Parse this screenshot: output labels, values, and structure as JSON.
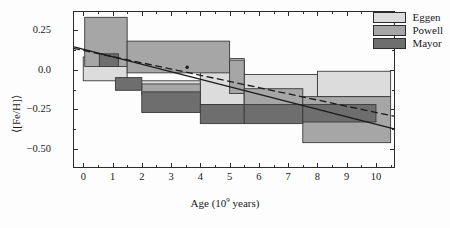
{
  "chart_data": {
    "type": "bar",
    "title": "",
    "xlabel": "Age (10⁹ years)",
    "ylabel": "⟨[Fe/H]⟩",
    "xlabel_base": "Age (10",
    "xlabel_exp": "9",
    "xlabel_tail": " years)",
    "xlim": [
      -0.35,
      10.65
    ],
    "ylim": [
      -0.62,
      0.37
    ],
    "grid": false,
    "legend_position": "top-right",
    "xticks": [
      0,
      1,
      2,
      3,
      4,
      5,
      6,
      7,
      8,
      9,
      10
    ],
    "xticklabels": [
      "0",
      "1",
      "2",
      "3",
      "4",
      "5",
      "6",
      "7",
      "8",
      "9",
      "10"
    ],
    "xminorticks": [
      0.5,
      1.5,
      2.5,
      3.5,
      4.5,
      5.5,
      6.5,
      7.5,
      8.5,
      9.5,
      10.5
    ],
    "yticks": [
      0.25,
      0.0,
      -0.25,
      -0.5
    ],
    "yticklabels": [
      "0.25",
      "0.0",
      "−0.25",
      "−0.50"
    ],
    "yminorticks": [
      0.375,
      0.125,
      -0.125,
      -0.375,
      -0.625
    ],
    "colors": {
      "eggen": "#dcdcdc",
      "powell": "#a6a6a6",
      "mayor": "#6e6e6e",
      "edge": "#3a3a3a",
      "axis": "#2b2b2b",
      "text": "#1a1a1a"
    },
    "series": [
      {
        "name": "Eggen",
        "color": "#dcdcdc",
        "boxes": [
          {
            "x0": 0.0,
            "x1": 1.5,
            "y0": -0.07,
            "y1": 0.08
          },
          {
            "x0": 1.5,
            "x1": 4.0,
            "y0": -0.12,
            "y1": -0.07
          },
          {
            "x0": 4.0,
            "x1": 5.5,
            "y0": -0.22,
            "y1": 0.07
          },
          {
            "x0": 5.5,
            "x1": 8.0,
            "y0": -0.22,
            "y1": -0.03
          },
          {
            "x0": 8.0,
            "x1": 10.5,
            "y0": -0.17,
            "y1": -0.01
          }
        ]
      },
      {
        "name": "Powell",
        "color": "#a6a6a6",
        "boxes": [
          {
            "x0": 0.05,
            "x1": 1.5,
            "y0": 0.02,
            "y1": 0.33
          },
          {
            "x0": 1.5,
            "x1": 5.0,
            "y0": -0.02,
            "y1": 0.18
          },
          {
            "x0": 5.0,
            "x1": 5.5,
            "y0": -0.15,
            "y1": 0.06
          },
          {
            "x0": 2.0,
            "x1": 4.0,
            "y0": -0.16,
            "y1": -0.09
          },
          {
            "x0": 5.5,
            "x1": 7.5,
            "y0": -0.27,
            "y1": -0.12
          },
          {
            "x0": 7.5,
            "x1": 10.5,
            "y0": -0.46,
            "y1": -0.17
          }
        ]
      },
      {
        "name": "Mayor",
        "color": "#6e6e6e",
        "boxes": [
          {
            "x0": 0.55,
            "x1": 1.2,
            "y0": 0.02,
            "y1": 0.1
          },
          {
            "x0": 1.1,
            "x1": 2.0,
            "y0": -0.13,
            "y1": -0.05
          },
          {
            "x0": 2.0,
            "x1": 4.0,
            "y0": -0.27,
            "y1": -0.14
          },
          {
            "x0": 4.0,
            "x1": 5.5,
            "y0": -0.34,
            "y1": -0.22
          },
          {
            "x0": 5.5,
            "x1": 7.5,
            "y0": -0.34,
            "y1": -0.22
          },
          {
            "x0": 7.5,
            "x1": 10.0,
            "y0": -0.33,
            "y1": -0.22
          }
        ]
      }
    ],
    "lines": [
      {
        "name": "solid-fit",
        "style": "solid",
        "color": "#1a1a1a",
        "x0": -0.35,
        "y0": 0.145,
        "x1": 10.65,
        "y1": -0.375
      },
      {
        "name": "dashed-fit",
        "style": "dashed",
        "color": "#1a1a1a",
        "x0": -0.35,
        "y0": 0.135,
        "x1": 10.65,
        "y1": -0.295
      }
    ],
    "point_markers": [
      {
        "x": 3.55,
        "y": 0.015
      }
    ]
  },
  "legend": {
    "items": [
      {
        "label": "Eggen",
        "color": "#dcdcdc"
      },
      {
        "label": "Powell",
        "color": "#a6a6a6"
      },
      {
        "label": "Mayor",
        "color": "#6e6e6e"
      }
    ]
  }
}
